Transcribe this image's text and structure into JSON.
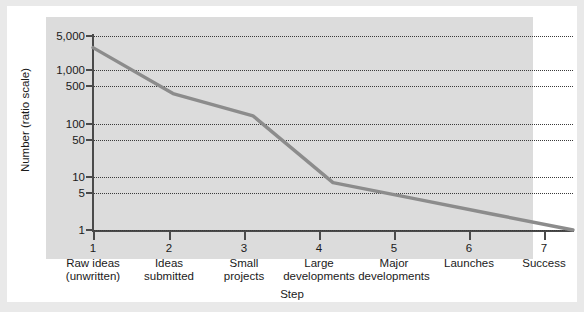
{
  "chart_data": {
    "type": "line",
    "title": "",
    "xlabel": "Step",
    "ylabel": "Number (ratio scale)",
    "yscale": "log",
    "ylim": [
      1,
      5000
    ],
    "grid": true,
    "legend": "none",
    "line_color": "#8c8c8c",
    "categories": [
      "1",
      "2",
      "3",
      "4",
      "5",
      "6",
      "7"
    ],
    "category_captions": [
      "Raw ideas\n(unwritten)",
      "Ideas\nsubmitted",
      "Small\nprojects",
      "Large\ndevelopments",
      "Major\ndevelopments",
      "Launches",
      "Success"
    ],
    "x": [
      1,
      2,
      3,
      4,
      5,
      6,
      7
    ],
    "values": [
      3000,
      400,
      150,
      8,
      4,
      2,
      1
    ],
    "yticks": [
      1,
      5,
      10,
      50,
      100,
      500,
      1000,
      5000
    ],
    "ytick_labels": [
      "1",
      "5",
      "10",
      "50",
      "100",
      "500",
      "1,000",
      "5,000"
    ]
  },
  "axes": {
    "y_title": "Number (ratio scale)",
    "x_title": "Step",
    "y_tick_labels": [
      "5,000",
      "1,000",
      "500",
      "100",
      "50",
      "10",
      "5",
      "1"
    ],
    "x_tick_numbers": [
      "1",
      "2",
      "3",
      "4",
      "5",
      "6",
      "7"
    ],
    "x_tick_captions_line1": [
      "Raw ideas",
      "Ideas",
      "Small",
      "Large",
      "Major",
      "Launches",
      "Success"
    ],
    "x_tick_captions_line2": [
      "(unwritten)",
      "submitted",
      "projects",
      "developments",
      "developments",
      "",
      ""
    ]
  },
  "colors": {
    "series": "#8c8c8c",
    "axis": "#4a4a4a",
    "grid": "#3a3a3a",
    "plot_background": "#dcdcdc",
    "card_background": "#ffffff",
    "page_background": "#e9e9e9"
  }
}
